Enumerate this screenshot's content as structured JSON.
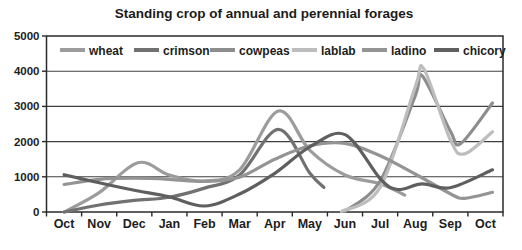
{
  "figure": {
    "title": "Standing crop of annual and perennial forages"
  },
  "chart_data": {
    "type": "line",
    "title": "Standing crop of annual and perennial forages",
    "x_categories": [
      "Oct",
      "Nov",
      "Dec",
      "Jan",
      "Feb",
      "Mar",
      "Apr",
      "May",
      "Jun",
      "Jul",
      "Aug",
      "Sep",
      "Oct"
    ],
    "x_unit": "month index, 0 = first Oct",
    "xlabel": "",
    "ylabel": "",
    "ylim": [
      0,
      5000
    ],
    "ytick_step": 1000,
    "grid": "horizontal",
    "line_style": "smooth",
    "legend_position": "top-inside-horizontal",
    "colors": {
      "axis": "#2a2a2a",
      "grid": "#3f3f3f",
      "background": "#ffffff",
      "text": "#1b1b1b"
    },
    "series": [
      {
        "name": "wheat",
        "color": "#9c9c9c",
        "points": [
          [
            0,
            0
          ],
          [
            1,
            550
          ],
          [
            2.1,
            1400
          ],
          [
            3,
            1050
          ],
          [
            4,
            880
          ],
          [
            5,
            1200
          ],
          [
            6.1,
            2870
          ],
          [
            7,
            1750
          ],
          [
            8,
            1050
          ],
          [
            9,
            800
          ],
          [
            9.7,
            480
          ]
        ]
      },
      {
        "name": "crimson",
        "color": "#717171",
        "points": [
          [
            0,
            0
          ],
          [
            1,
            200
          ],
          [
            2,
            330
          ],
          [
            3,
            420
          ],
          [
            4,
            680
          ],
          [
            5,
            1050
          ],
          [
            6.1,
            2350
          ],
          [
            7,
            1100
          ],
          [
            7.4,
            700
          ]
        ]
      },
      {
        "name": "cowpeas",
        "color": "#8d8d8d",
        "points": [
          [
            8,
            20
          ],
          [
            9,
            880
          ],
          [
            10,
            3300
          ],
          [
            10.2,
            3870
          ],
          [
            11,
            2300
          ],
          [
            11.3,
            1950
          ],
          [
            12.2,
            3100
          ]
        ]
      },
      {
        "name": "lablab",
        "color": "#bdbdbd",
        "points": [
          [
            7.9,
            10
          ],
          [
            9,
            700
          ],
          [
            10,
            3550
          ],
          [
            10.25,
            4060
          ],
          [
            11,
            2050
          ],
          [
            11.4,
            1650
          ],
          [
            12.2,
            2280
          ]
        ]
      },
      {
        "name": "ladino",
        "color": "#949494",
        "points": [
          [
            0,
            780
          ],
          [
            1,
            930
          ],
          [
            2,
            960
          ],
          [
            3,
            930
          ],
          [
            4,
            870
          ],
          [
            5,
            990
          ],
          [
            6,
            1500
          ],
          [
            7,
            1880
          ],
          [
            8,
            1950
          ],
          [
            9,
            1600
          ],
          [
            10,
            1080
          ],
          [
            11,
            520
          ],
          [
            11.4,
            390
          ],
          [
            12.2,
            560
          ]
        ]
      },
      {
        "name": "chicory",
        "color": "#5f5f5f",
        "points": [
          [
            0,
            1060
          ],
          [
            1,
            830
          ],
          [
            2,
            620
          ],
          [
            3,
            430
          ],
          [
            4,
            170
          ],
          [
            5,
            510
          ],
          [
            6,
            1100
          ],
          [
            7,
            1850
          ],
          [
            8,
            2200
          ],
          [
            9,
            950
          ],
          [
            9.5,
            640
          ],
          [
            10.2,
            800
          ],
          [
            11,
            690
          ],
          [
            12.2,
            1200
          ]
        ]
      }
    ]
  }
}
